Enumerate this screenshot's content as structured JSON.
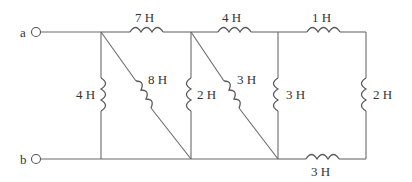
{
  "diagram": {
    "type": "inductor-network",
    "terminals": [
      {
        "id": "a",
        "label": "a"
      },
      {
        "id": "b",
        "label": "b"
      }
    ],
    "inductors": [
      {
        "id": "L_top1",
        "label": "7 H",
        "value_h": 7,
        "position": "top wire between node 1 and node 2"
      },
      {
        "id": "L_top2",
        "label": "4 H",
        "value_h": 4,
        "position": "top wire between node 2 and node 3"
      },
      {
        "id": "L_top3",
        "label": "1 H",
        "value_h": 1,
        "position": "top wire between node 3 and node 4"
      },
      {
        "id": "L_v1",
        "label": "4 H",
        "value_h": 4,
        "position": "vertical at node 1"
      },
      {
        "id": "L_d1",
        "label": "8 H",
        "value_h": 8,
        "position": "diagonal from top node 1 to bottom node 2"
      },
      {
        "id": "L_v2",
        "label": "2 H",
        "value_h": 2,
        "position": "vertical at node 2"
      },
      {
        "id": "L_d2",
        "label": "3 H",
        "value_h": 3,
        "position": "diagonal from top node 2 to bottom node 3"
      },
      {
        "id": "L_v3",
        "label": "3 H",
        "value_h": 3,
        "position": "vertical at node 3"
      },
      {
        "id": "L_v4",
        "label": "2 H",
        "value_h": 2,
        "position": "vertical at right edge node 4"
      },
      {
        "id": "L_bot",
        "label": "3 H",
        "value_h": 3,
        "position": "bottom wire between node 3 and node 4"
      }
    ]
  },
  "labels": {
    "a": "a",
    "b": "b",
    "top1": "7 H",
    "top2": "4 H",
    "top3": "1 H",
    "v1": "4 H",
    "d1": "8 H",
    "v2": "2 H",
    "d2": "3 H",
    "v3": "3 H",
    "v4": "2 H",
    "bot": "3 H"
  }
}
